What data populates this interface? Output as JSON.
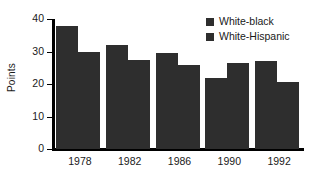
{
  "chart_data": {
    "type": "bar",
    "title": "",
    "subtitle": "",
    "xlabel": "",
    "ylabel": "Points",
    "categories": [
      "1978",
      "1982",
      "1986",
      "1990",
      "1992"
    ],
    "series": [
      {
        "name": "White-black",
        "color": "#2e2e2e",
        "values": [
          38,
          32,
          29.5,
          22,
          27
        ]
      },
      {
        "name": "White-Hispanic",
        "color": "#2e2e2e",
        "values": [
          30,
          27.5,
          25.8,
          26.5,
          20.5
        ]
      }
    ],
    "ylim": [
      0,
      40
    ],
    "yticks": [
      0,
      10,
      20,
      30,
      40
    ],
    "ytick_labels": [
      "0",
      "10",
      "20",
      "30",
      "40"
    ],
    "grid": false,
    "legend_position": "top-right",
    "annotations": []
  },
  "style": {
    "axis_color": "#000000",
    "text_color": "#1a1a1a",
    "background": "#ffffff",
    "bar_color": "#2e2e2e"
  }
}
